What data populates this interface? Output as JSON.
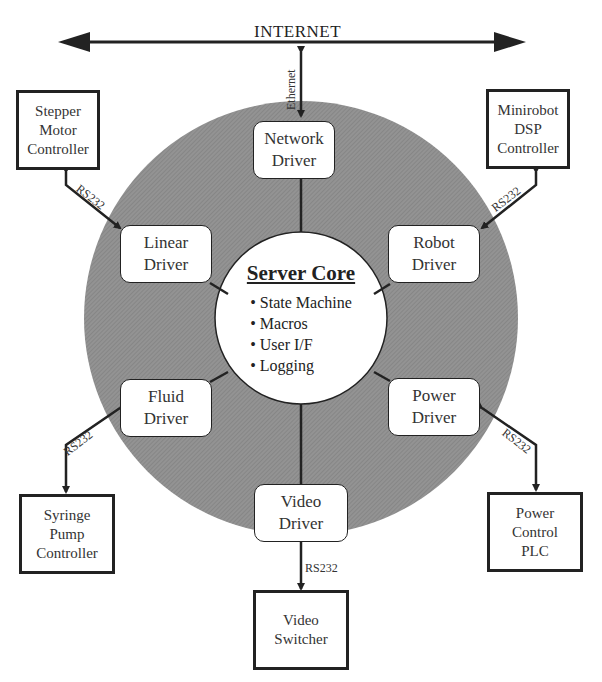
{
  "internet": {
    "label": "INTERNET"
  },
  "links": {
    "ethernet": "Ethernet",
    "rs232": "RS232"
  },
  "core": {
    "title": "Server Core",
    "items": [
      "State Machine",
      "Macros",
      "User I/F",
      "Logging"
    ]
  },
  "drivers": {
    "network": [
      "Network",
      "Driver"
    ],
    "linear": [
      "Linear",
      "Driver"
    ],
    "robot": [
      "Robot",
      "Driver"
    ],
    "fluid": [
      "Fluid",
      "Driver"
    ],
    "power": [
      "Power",
      "Driver"
    ],
    "video": [
      "Video",
      "Driver"
    ]
  },
  "devices": {
    "stepper": [
      "Stepper",
      "Motor",
      "Controller"
    ],
    "minirobot": [
      "Minirobot",
      "DSP",
      "Controller"
    ],
    "syringe": [
      "Syringe",
      "Pump",
      "Controller"
    ],
    "plc": [
      "Power",
      "Control",
      "PLC"
    ],
    "switcher": [
      "Video",
      "Switcher"
    ]
  },
  "colors": {
    "ring": "#8a8a8a",
    "line": "#222222"
  }
}
